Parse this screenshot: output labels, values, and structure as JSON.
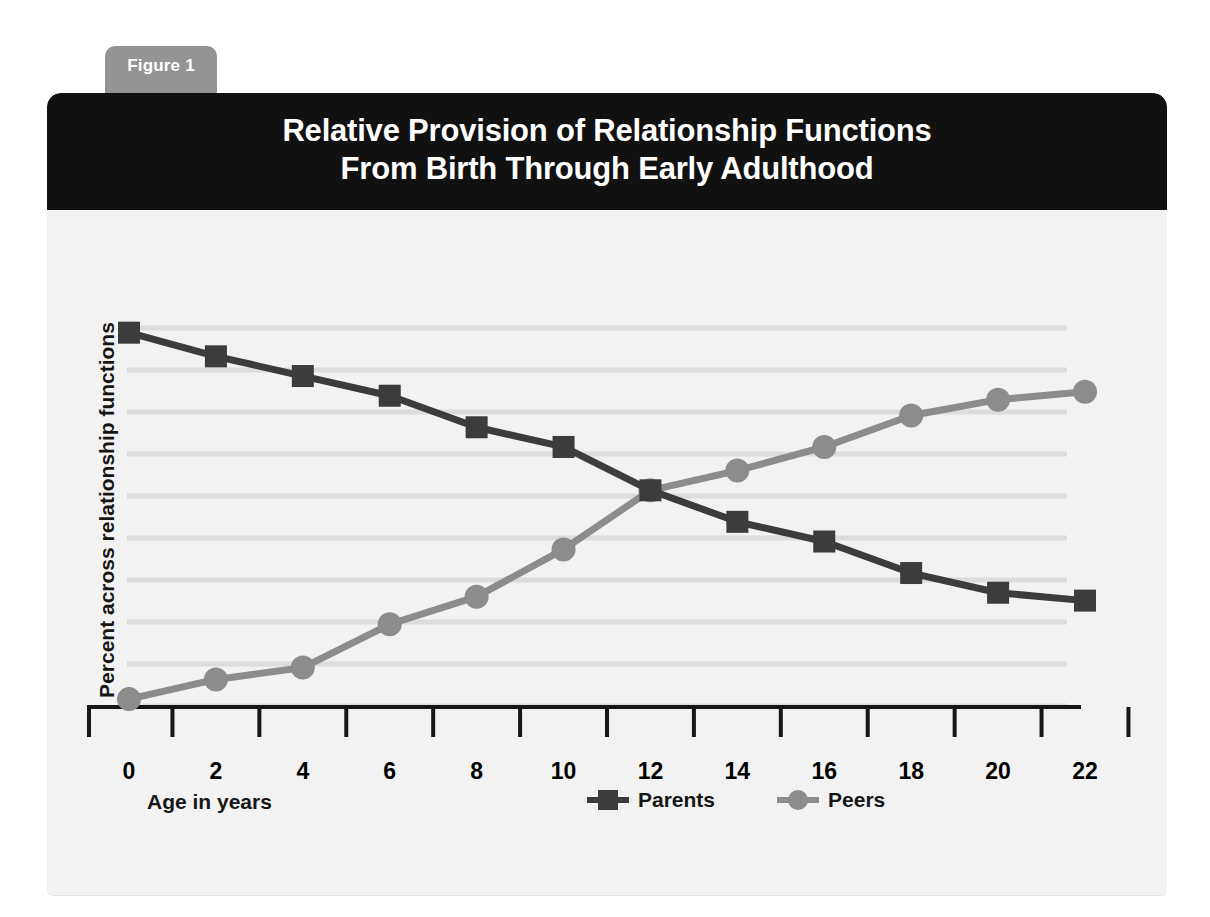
{
  "figure_tab": {
    "label": "Figure 1"
  },
  "header": {
    "title_line1": "Relative Provision of Relationship Functions",
    "title_line2": "From Birth Through Early Adulthood"
  },
  "axis": {
    "xlabel": "Age in years",
    "ylabel": "Percent across relationship functions"
  },
  "legend": {
    "items": [
      {
        "label": "Parents",
        "marker": "square",
        "color": "#3c3c3c"
      },
      {
        "label": "Peers",
        "marker": "circle",
        "color": "#8c8c8c"
      }
    ]
  },
  "colors": {
    "parents": "#3c3c3c",
    "peers": "#8c8c8c",
    "header_bg": "#111111",
    "tab_bg": "#949494",
    "card_bg": "#f2f2f2",
    "gridline": "#dcdcdc",
    "axis": "#161616"
  },
  "chart_data": {
    "type": "line",
    "title": "Relative Provision of Relationship Functions From Birth Through Early Adulthood",
    "xlabel": "Age in years",
    "ylabel": "Percent across relationship functions",
    "x": [
      0,
      2,
      4,
      6,
      8,
      10,
      12,
      14,
      16,
      18,
      20,
      22
    ],
    "xticklabels": [
      "0",
      "2",
      "4",
      "6",
      "8",
      "10",
      "12",
      "14",
      "16",
      "18",
      "20",
      "22"
    ],
    "xlim": [
      0,
      22
    ],
    "ylim": [
      0,
      100
    ],
    "yticklabels": [],
    "grid": "horizontal",
    "gridline_count": 10,
    "legend_position": "bottom-right",
    "series": [
      {
        "name": "Parents",
        "marker": "square",
        "color": "#3c3c3c",
        "values": [
          95,
          89,
          84,
          79,
          71,
          66,
          55,
          47,
          42,
          34,
          29,
          27
        ]
      },
      {
        "name": "Peers",
        "marker": "circle",
        "color": "#8c8c8c",
        "values": [
          2,
          7,
          10,
          21,
          28,
          40,
          55,
          60,
          66,
          74,
          78,
          80
        ]
      }
    ],
    "annotations": [
      "Parents line declines monotonically from birth through early adulthood",
      "Peers line rises monotonically and crosses the Parents line at age 12"
    ]
  }
}
